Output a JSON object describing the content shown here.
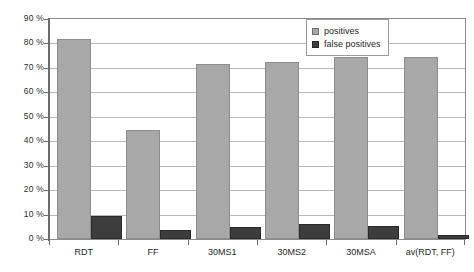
{
  "chart_data": {
    "type": "bar",
    "title": "",
    "subtitle": "",
    "xlabel": "",
    "ylabel": "",
    "ylim": [
      0,
      90
    ],
    "ytick_labels": [
      "0 %",
      "10 %",
      "20 %",
      "30 %",
      "40 %",
      "50 %",
      "60 %",
      "70 %",
      "80 %",
      "90 %"
    ],
    "ytick_values": [
      0,
      10,
      20,
      30,
      40,
      50,
      60,
      70,
      80,
      90
    ],
    "grid": "horizontal",
    "legend_position": "top-right-inside",
    "categories": [
      "RDT",
      "FF",
      "30MS1",
      "30MS2",
      "30MSA",
      "av(RDT, FF)"
    ],
    "series": [
      {
        "name": "positives",
        "color": "#a8a8a8",
        "values": [
          82.0,
          44.8,
          71.5,
          72.3,
          74.6,
          74.6
        ]
      },
      {
        "name": "false positives",
        "color": "#3d3d3d",
        "values": [
          9.3,
          3.6,
          5.0,
          6.3,
          5.2,
          1.6
        ]
      }
    ]
  },
  "legend": {
    "entries": [
      {
        "label": "positives",
        "swatch": "positives"
      },
      {
        "label": "false positives",
        "swatch": "falsepositives"
      }
    ]
  },
  "colors": {
    "positives": "#a8a8a8",
    "false_positives": "#3d3d3d",
    "gridline": "#b9b9b9",
    "axis": "#6b6b6b",
    "plot_border": "#8c8c8c",
    "background": "#ffffff"
  }
}
